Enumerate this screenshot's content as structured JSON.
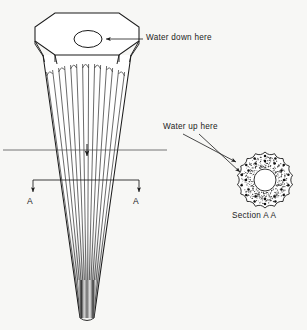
{
  "figure": {
    "type": "technical-line-drawing",
    "background_color": "#f7f7f5",
    "ink_color": "#1b1b1b"
  },
  "labels": {
    "water_down": "Water down here",
    "water_up": "Water up here",
    "section_caption": "Section A A",
    "section_marker_left": "A",
    "section_marker_right": "A"
  },
  "annotations": {
    "water_down_target": "central-hole-top-face",
    "water_up_targets": "flute-grooves-in-section",
    "section_line_label": "A-A"
  },
  "main_view": {
    "name": "fluted-cone-body",
    "top_face": {
      "shape": "octagon",
      "center_x": 87,
      "center_y": 33,
      "radius_x": 52,
      "radius_y": 27
    },
    "top_hole": {
      "shape": "ellipse",
      "center_x": 88,
      "center_y": 39,
      "radius_x": 14,
      "radius_y": 8.5
    },
    "taper": {
      "top_half_width": 44,
      "bottom_half_width": 7,
      "top_y": 55,
      "bottom_y": 318
    },
    "flute_count": 14,
    "flute_top_y": 72,
    "shading": "dark-toward-lower-tip"
  },
  "section_view": {
    "name": "section-a-a",
    "center_x": 265,
    "center_y": 180,
    "outer_radius": 28,
    "inner_radius": 11,
    "lobe_count": 18,
    "lobe_depth": 4.0,
    "stipple": true,
    "dot_rings": [
      19,
      24
    ],
    "dot_counts": [
      12,
      14
    ]
  },
  "section_line": {
    "name": "section-cut-line",
    "y": 180,
    "left_x": 33,
    "right_x": 139,
    "arrow_direction": "down"
  },
  "center_line": {
    "name": "horizontal-centre-line",
    "y": 150,
    "left_x": 3,
    "right_x": 167
  },
  "leader_lines": {
    "water_down": {
      "from_x": 143,
      "from_y": 39,
      "to_x": 104,
      "to_y": 39
    },
    "water_up_1": {
      "from_x": 183,
      "from_y": 134,
      "to_x": 238,
      "to_y": 163
    },
    "water_up_2": {
      "from_x": 197,
      "from_y": 134,
      "to_x": 241,
      "to_y": 171
    }
  }
}
